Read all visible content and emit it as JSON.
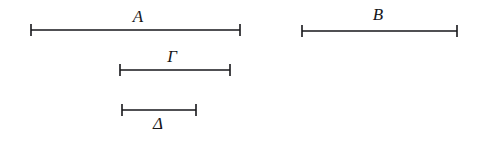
{
  "figure": {
    "type": "line-segment-comparison-diagram",
    "background_color": "#ffffff",
    "stroke_color": "#16161a",
    "width": 484,
    "height": 143,
    "segments": [
      {
        "id": "A",
        "label": "A",
        "label_position": "above",
        "x_start": 31,
        "x_end": 240,
        "y": 30,
        "length_px": 209,
        "label_x": 138,
        "label_y": 8
      },
      {
        "id": "B",
        "label": "B",
        "label_position": "above",
        "x_start": 302,
        "x_end": 457,
        "y": 31,
        "length_px": 155,
        "label_x": 378,
        "label_y": 6
      },
      {
        "id": "G",
        "label": "Γ",
        "label_position": "above",
        "x_start": 120,
        "x_end": 230,
        "y": 70,
        "length_px": 110,
        "label_x": 172,
        "label_y": 48
      },
      {
        "id": "D",
        "label": "Δ",
        "label_position": "below",
        "x_start": 122,
        "x_end": 196,
        "y": 110,
        "length_px": 74,
        "label_x": 158,
        "label_y": 115
      }
    ],
    "tick_half_height": 6,
    "line_width": 1.6
  }
}
